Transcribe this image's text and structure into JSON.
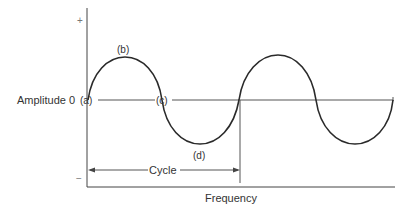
{
  "diagram": {
    "y_axis": {
      "label": "Amplitude 0",
      "plus_sign": "+",
      "minus_sign": "−"
    },
    "x_axis": {
      "label": "Frequency"
    },
    "points": {
      "a": "(a)",
      "b": "(b)",
      "c": "(c)",
      "d": "(d)"
    },
    "cycle": {
      "label": "Cycle"
    },
    "colors": {
      "wave": "#2a2a2a",
      "axis": "#444444",
      "guide": "#555555",
      "text": "#333333"
    },
    "wave": {
      "cycles_shown": 2,
      "description": "Two full sine cycles; first cycle annotated with points a (start at zero), b (positive peak), c (zero crossing), d (negative trough)"
    }
  }
}
